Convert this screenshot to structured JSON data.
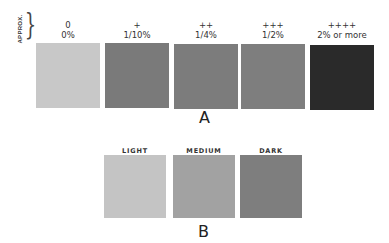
{
  "approx_label": "APPROX.",
  "panel_a": {
    "caption": "A",
    "swatches": [
      {
        "symbol": "0",
        "percent": "0%",
        "color": "#c8c8c8"
      },
      {
        "symbol": "+",
        "percent": "1/10%",
        "color": "#7a7a7a"
      },
      {
        "symbol": "++",
        "percent": "1/4%",
        "color": "#7c7c7c"
      },
      {
        "symbol": "+++",
        "percent": "1/2%",
        "color": "#7e7e7e"
      },
      {
        "symbol": "++++",
        "percent": "2% or more",
        "color": "#2a2a2a"
      }
    ]
  },
  "panel_b": {
    "caption": "B",
    "swatches": [
      {
        "label": "LIGHT",
        "color": "#c4c4c4"
      },
      {
        "label": "MEDIUM",
        "color": "#a2a2a2"
      },
      {
        "label": "DARK",
        "color": "#7e7e7e"
      }
    ]
  }
}
